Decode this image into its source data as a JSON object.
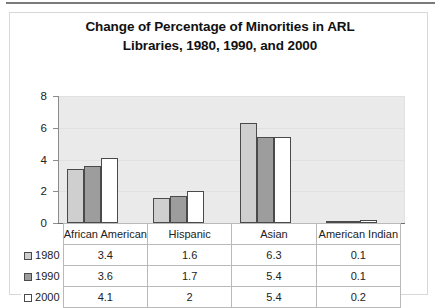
{
  "chart_data": {
    "type": "bar",
    "title": "Change of Percentage of Minorities in ARL Libraries, 1980, 1990, and 2000",
    "title_lines": [
      "Change of Percentage of Minorities in ARL",
      "Libraries, 1980, 1990, and 2000"
    ],
    "xlabel": "",
    "ylabel": "",
    "ylim": [
      0,
      8
    ],
    "yticks": [
      0,
      2,
      4,
      6,
      8
    ],
    "ytick_labels": [
      "0",
      "2",
      "4",
      "6",
      "8"
    ],
    "grid": true,
    "legend_position": "data-table-left",
    "categories": [
      "African American",
      "Hispanic",
      "Asian",
      "American Indian"
    ],
    "series": [
      {
        "name": "1980",
        "color": "#cfcfcf",
        "values": [
          3.4,
          1.6,
          6.3,
          0.1
        ]
      },
      {
        "name": "1990",
        "color": "#9d9d9d",
        "values": [
          3.6,
          1.7,
          5.4,
          0.1
        ]
      },
      {
        "name": "2000",
        "color": "#ffffff",
        "values": [
          4.1,
          2,
          5.4,
          0.2
        ]
      }
    ],
    "value_labels": [
      [
        "3.4",
        "1.6",
        "6.3",
        "0.1"
      ],
      [
        "3.6",
        "1.7",
        "5.4",
        "0.1"
      ],
      [
        "4.1",
        "2",
        "5.4",
        "0.2"
      ]
    ],
    "colors": {
      "plot_background": "#eaeaea",
      "bar_outline": "#4a4a4a",
      "axis": "#8c8c8c",
      "grid": "#e0e0e0",
      "text": "#1a1a1a",
      "table_border": "#b9b9b9"
    }
  }
}
